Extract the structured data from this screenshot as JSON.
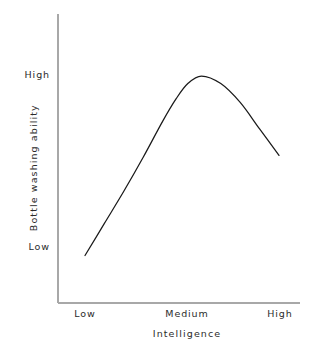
{
  "chart_data": {
    "type": "line",
    "title": "",
    "xlabel": "Intelligence",
    "ylabel": "Bottle washing ability",
    "grid": false,
    "legend": false,
    "xticks": [
      "Low",
      "Medium",
      "High"
    ],
    "yticks": [
      "Low",
      "High"
    ],
    "xlim": [
      0,
      1
    ],
    "ylim": [
      0,
      1
    ],
    "series": [
      {
        "name": "Bottle washing ability",
        "comment": "inverted-U: rises steeply from Low intelligence, peaks just past Medium at High ability, then declines",
        "x": [
          0.0,
          0.1,
          0.2,
          0.3,
          0.4,
          0.47,
          0.53,
          0.6,
          0.7,
          0.8,
          0.9,
          1.0
        ],
        "y": [
          0.05,
          0.22,
          0.39,
          0.57,
          0.76,
          0.88,
          0.96,
          1.0,
          0.96,
          0.86,
          0.72,
          0.58
        ]
      }
    ],
    "line_color": "#1a1a1a",
    "axis_color": "#a8a8a8",
    "background_color": "#ffffff"
  },
  "axes": {
    "y": {
      "title": "Bottle washing ability",
      "ticks": {
        "high": "High",
        "low": "Low"
      }
    },
    "x": {
      "title": "Intelligence",
      "ticks": {
        "low": "Low",
        "medium": "Medium",
        "high": "High"
      }
    }
  }
}
